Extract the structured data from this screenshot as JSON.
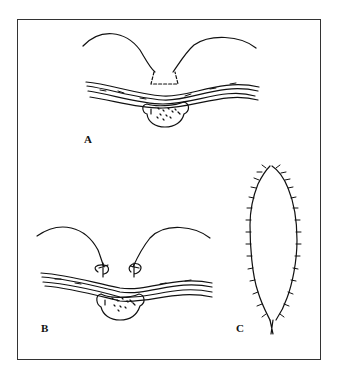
{
  "figure": {
    "panels": [
      {
        "id": "A",
        "label": "A",
        "description": "Skin flaps with dashed excision outline above layered tissue and vertebral body"
      },
      {
        "id": "B",
        "label": "B",
        "description": "Flaps sutured down to tissue layer with two sutures"
      },
      {
        "id": "C",
        "label": "C",
        "description": "Oval closed incision with interrupted sutures along both edges"
      }
    ],
    "colors": {
      "line": "#111111",
      "background": "#ffffff",
      "frame": "#333333"
    }
  }
}
